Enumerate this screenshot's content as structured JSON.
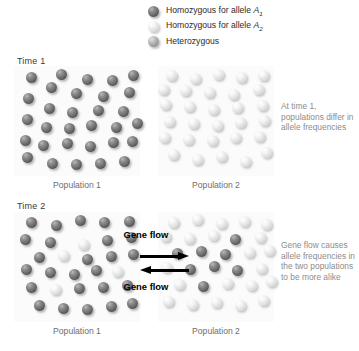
{
  "legend": {
    "items": [
      {
        "type": "dark",
        "label_prefix": "Homozygous for allele ",
        "allele": "A",
        "sub": "1",
        "name": "homozygous-a1"
      },
      {
        "type": "light",
        "label_prefix": "Homozygous for allele ",
        "allele": "A",
        "sub": "2",
        "name": "homozygous-a2"
      },
      {
        "type": "hetero",
        "label_prefix": "Heterozygous",
        "allele": "",
        "sub": "",
        "name": "heterozygous"
      }
    ]
  },
  "rows": {
    "time1": {
      "label": "Time 1"
    },
    "time2": {
      "label": "Time 2"
    }
  },
  "populations": {
    "t1p1": "Population 1",
    "t1p2": "Population 2",
    "t2p1": "Population 1",
    "t2p2": "Population 2"
  },
  "captions": {
    "time1": "At time 1, populations differ in allele frequencies",
    "time2": "Gene flow causes allele frequencies in the two populations to be more alike"
  },
  "gene_flow": {
    "top_label": "Gene flow",
    "bottom_label": "Gene flow",
    "top_direction": "right",
    "bottom_direction": "left"
  },
  "colors": {
    "allele_a1_dark": "#4e4e4e",
    "allele_a2_light": "#e2e2e2",
    "heterozygous_mid": "#a5a5a5",
    "panel_background": "#fbfbfb",
    "caption_gray": "#8c8c8c",
    "arrow_black": "#000000"
  },
  "sphere_diameter": 11,
  "populations_data": {
    "t1p1": {
      "counts": {
        "dark": 28,
        "light": 0,
        "hetero": 0
      },
      "spheres": [
        {
          "t": "dark",
          "x": 12,
          "y": 6
        },
        {
          "t": "dark",
          "x": 42,
          "y": 3
        },
        {
          "t": "dark",
          "x": 68,
          "y": 8
        },
        {
          "t": "dark",
          "x": 93,
          "y": 9
        },
        {
          "t": "dark",
          "x": 114,
          "y": 4
        },
        {
          "t": "dark",
          "x": 32,
          "y": 16
        },
        {
          "t": "dark",
          "x": 57,
          "y": 22
        },
        {
          "t": "dark",
          "x": 84,
          "y": 25
        },
        {
          "t": "dark",
          "x": 110,
          "y": 21
        },
        {
          "t": "dark",
          "x": 9,
          "y": 27
        },
        {
          "t": "dark",
          "x": 30,
          "y": 37
        },
        {
          "t": "dark",
          "x": 53,
          "y": 41
        },
        {
          "t": "dark",
          "x": 79,
          "y": 39
        },
        {
          "t": "dark",
          "x": 104,
          "y": 40
        },
        {
          "t": "dark",
          "x": 8,
          "y": 48
        },
        {
          "t": "dark",
          "x": 27,
          "y": 56
        },
        {
          "t": "dark",
          "x": 50,
          "y": 57
        },
        {
          "t": "dark",
          "x": 72,
          "y": 54
        },
        {
          "t": "dark",
          "x": 97,
          "y": 56
        },
        {
          "t": "dark",
          "x": 118,
          "y": 52
        },
        {
          "t": "dark",
          "x": 6,
          "y": 69
        },
        {
          "t": "dark",
          "x": 24,
          "y": 74
        },
        {
          "t": "dark",
          "x": 48,
          "y": 72
        },
        {
          "t": "dark",
          "x": 71,
          "y": 75
        },
        {
          "t": "dark",
          "x": 94,
          "y": 71
        },
        {
          "t": "dark",
          "x": 113,
          "y": 70
        },
        {
          "t": "dark",
          "x": 8,
          "y": 86
        },
        {
          "t": "dark",
          "x": 33,
          "y": 92
        },
        {
          "t": "dark",
          "x": 57,
          "y": 93
        },
        {
          "t": "dark",
          "x": 81,
          "y": 92
        },
        {
          "t": "dark",
          "x": 105,
          "y": 90
        }
      ]
    },
    "t1p2": {
      "counts": {
        "dark": 0,
        "light": 30,
        "hetero": 0
      },
      "spheres": [
        {
          "t": "light",
          "x": 8,
          "y": 4
        },
        {
          "t": "light",
          "x": 32,
          "y": 7
        },
        {
          "t": "light",
          "x": 55,
          "y": 3
        },
        {
          "t": "light",
          "x": 78,
          "y": 6
        },
        {
          "t": "light",
          "x": 100,
          "y": 4
        },
        {
          "t": "light",
          "x": 0,
          "y": 18
        },
        {
          "t": "light",
          "x": 22,
          "y": 19
        },
        {
          "t": "light",
          "x": 46,
          "y": 21
        },
        {
          "t": "light",
          "x": 70,
          "y": 23
        },
        {
          "t": "light",
          "x": 95,
          "y": 18
        },
        {
          "t": "light",
          "x": 2,
          "y": 33
        },
        {
          "t": "light",
          "x": 26,
          "y": 35
        },
        {
          "t": "light",
          "x": 50,
          "y": 38
        },
        {
          "t": "light",
          "x": 74,
          "y": 36
        },
        {
          "t": "light",
          "x": 99,
          "y": 34
        },
        {
          "t": "light",
          "x": 6,
          "y": 50
        },
        {
          "t": "light",
          "x": 30,
          "y": 52
        },
        {
          "t": "light",
          "x": 54,
          "y": 54
        },
        {
          "t": "light",
          "x": 77,
          "y": 51
        },
        {
          "t": "light",
          "x": 101,
          "y": 49
        },
        {
          "t": "light",
          "x": 1,
          "y": 66
        },
        {
          "t": "light",
          "x": 25,
          "y": 68
        },
        {
          "t": "light",
          "x": 49,
          "y": 69
        },
        {
          "t": "light",
          "x": 72,
          "y": 66
        },
        {
          "t": "light",
          "x": 96,
          "y": 65
        },
        {
          "t": "light",
          "x": 10,
          "y": 83
        },
        {
          "t": "light",
          "x": 34,
          "y": 88
        },
        {
          "t": "light",
          "x": 58,
          "y": 85
        },
        {
          "t": "light",
          "x": 82,
          "y": 90
        },
        {
          "t": "light",
          "x": 103,
          "y": 81
        }
      ]
    },
    "t2p1": {
      "counts": {
        "dark": 24,
        "light": 5,
        "hetero": 0
      },
      "spheres": [
        {
          "t": "dark",
          "x": 12,
          "y": 5
        },
        {
          "t": "dark",
          "x": 37,
          "y": 8
        },
        {
          "t": "dark",
          "x": 61,
          "y": 3
        },
        {
          "t": "dark",
          "x": 85,
          "y": 5
        },
        {
          "t": "dark",
          "x": 110,
          "y": 4
        },
        {
          "t": "dark",
          "x": 6,
          "y": 22
        },
        {
          "t": "dark",
          "x": 31,
          "y": 25
        },
        {
          "t": "light",
          "x": 64,
          "y": 27
        },
        {
          "t": "dark",
          "x": 88,
          "y": 23
        },
        {
          "t": "dark",
          "x": 112,
          "y": 20
        },
        {
          "t": "light",
          "x": 44,
          "y": 38
        },
        {
          "t": "dark",
          "x": 20,
          "y": 40
        },
        {
          "t": "dark",
          "x": 68,
          "y": 42
        },
        {
          "t": "dark",
          "x": 92,
          "y": 39
        },
        {
          "t": "dark",
          "x": 114,
          "y": 37
        },
        {
          "t": "dark",
          "x": 7,
          "y": 52
        },
        {
          "t": "dark",
          "x": 31,
          "y": 55
        },
        {
          "t": "dark",
          "x": 55,
          "y": 57
        },
        {
          "t": "light",
          "x": 98,
          "y": 54
        },
        {
          "t": "dark",
          "x": 77,
          "y": 53
        },
        {
          "t": "light",
          "x": 36,
          "y": 72
        },
        {
          "t": "dark",
          "x": 12,
          "y": 70
        },
        {
          "t": "dark",
          "x": 60,
          "y": 71
        },
        {
          "t": "dark",
          "x": 84,
          "y": 70
        },
        {
          "t": "dark",
          "x": 108,
          "y": 68
        },
        {
          "t": "dark",
          "x": 20,
          "y": 88
        },
        {
          "t": "dark",
          "x": 44,
          "y": 91
        },
        {
          "t": "dark",
          "x": 68,
          "y": 92
        },
        {
          "t": "dark",
          "x": 92,
          "y": 89
        },
        {
          "t": "dark",
          "x": 113,
          "y": 86
        }
      ]
    },
    "t2p2": {
      "counts": {
        "dark": 11,
        "light": 20,
        "hetero": 0
      },
      "spheres": [
        {
          "t": "light",
          "x": 10,
          "y": 5
        },
        {
          "t": "light",
          "x": 34,
          "y": 2
        },
        {
          "t": "light",
          "x": 58,
          "y": 6
        },
        {
          "t": "light",
          "x": 81,
          "y": 4
        },
        {
          "t": "light",
          "x": 103,
          "y": 7
        },
        {
          "t": "light",
          "x": 2,
          "y": 19
        },
        {
          "t": "light",
          "x": 26,
          "y": 21
        },
        {
          "t": "light",
          "x": 50,
          "y": 18
        },
        {
          "t": "dark",
          "x": 72,
          "y": 22
        },
        {
          "t": "light",
          "x": 97,
          "y": 20
        },
        {
          "t": "dark",
          "x": 14,
          "y": 36
        },
        {
          "t": "dark",
          "x": 38,
          "y": 34
        },
        {
          "t": "dark",
          "x": 62,
          "y": 37
        },
        {
          "t": "light",
          "x": 86,
          "y": 35
        },
        {
          "t": "light",
          "x": 106,
          "y": 33
        },
        {
          "t": "light",
          "x": 3,
          "y": 50
        },
        {
          "t": "dark",
          "x": 27,
          "y": 52
        },
        {
          "t": "dark",
          "x": 51,
          "y": 49
        },
        {
          "t": "dark",
          "x": 74,
          "y": 53
        },
        {
          "t": "light",
          "x": 98,
          "y": 51
        },
        {
          "t": "light",
          "x": 16,
          "y": 67
        },
        {
          "t": "dark",
          "x": 40,
          "y": 69
        },
        {
          "t": "light",
          "x": 64,
          "y": 66
        },
        {
          "t": "light",
          "x": 88,
          "y": 68
        },
        {
          "t": "light",
          "x": 108,
          "y": 64
        },
        {
          "t": "light",
          "x": 5,
          "y": 84
        },
        {
          "t": "light",
          "x": 29,
          "y": 87
        },
        {
          "t": "light",
          "x": 53,
          "y": 85
        },
        {
          "t": "light",
          "x": 77,
          "y": 88
        },
        {
          "t": "light",
          "x": 100,
          "y": 83
        }
      ]
    }
  }
}
